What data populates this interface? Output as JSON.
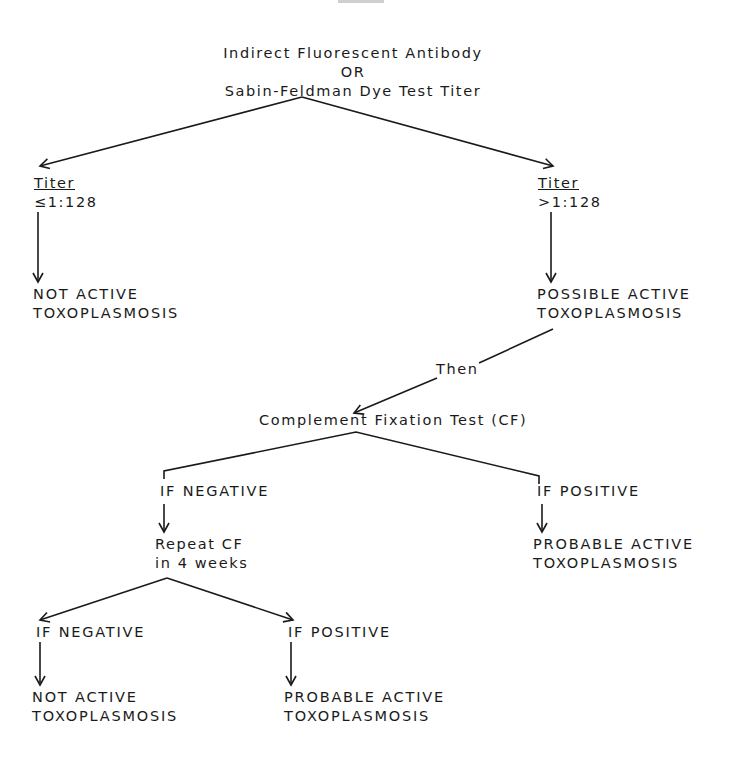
{
  "diagram": {
    "root": {
      "line1": "Indirect Fluorescent Antibody",
      "line2": "OR",
      "line3": "Sabin-Feldman Dye Test Titer"
    },
    "left_titer": {
      "label": "Titer",
      "value": "≤1:128"
    },
    "right_titer": {
      "label": "Titer",
      "value": ">1:128"
    },
    "left_result": {
      "line1": "NOT ACTIVE",
      "line2": "TOXOPLASMOSIS"
    },
    "right_result": {
      "line1": "POSSIBLE ACTIVE",
      "line2": "TOXOPLASMOSIS"
    },
    "connector": "Then",
    "cf_test": "Complement Fixation Test (CF)",
    "cf_negative": "IF NEGATIVE",
    "cf_positive": "IF POSITIVE",
    "repeat": {
      "line1": "Repeat CF",
      "line2": "in 4 weeks"
    },
    "cf_positive_result": {
      "line1": "PROBABLE ACTIVE",
      "line2": "TOXOPLASMOSIS"
    },
    "repeat_negative": "IF NEGATIVE",
    "repeat_positive": "IF POSITIVE",
    "repeat_negative_result": {
      "line1": "NOT ACTIVE",
      "line2": "TOXOPLASMOSIS"
    },
    "repeat_positive_result": {
      "line1": "PROBABLE ACTIVE",
      "line2": "TOXOPLASMOSIS"
    }
  }
}
